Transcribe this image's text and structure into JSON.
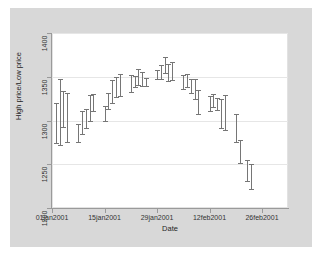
{
  "chart_data": {
    "type": "bar",
    "subtype": "range-high-low",
    "title": "",
    "xlabel": "Date",
    "ylabel": "High price/Low price",
    "ylim": [
      1200,
      1400
    ],
    "yticks": [
      1200,
      1250,
      1300,
      1350,
      1400
    ],
    "ytick_labels": [
      "1200",
      "1250",
      "1300",
      "1350",
      "1400"
    ],
    "xticks": [
      "01jan2001",
      "15jan2001",
      "29jan2001",
      "12feb2001",
      "26feb2001"
    ],
    "xtick_days": [
      0,
      14,
      28,
      42,
      56
    ],
    "grid": true,
    "legend": null,
    "series": [
      {
        "name": "High price/Low price",
        "low_name": "Low price",
        "high_name": "High price",
        "color": "#767676",
        "points": [
          {
            "day": 1,
            "date": "02jan2001",
            "low": 1274,
            "high": 1320
          },
          {
            "day": 2,
            "date": "03jan2001",
            "low": 1272,
            "high": 1348
          },
          {
            "day": 3,
            "date": "04jan2001",
            "low": 1293,
            "high": 1334
          },
          {
            "day": 4,
            "date": "05jan2001",
            "low": 1276,
            "high": 1331
          },
          {
            "day": 7,
            "date": "08jan2001",
            "low": 1275,
            "high": 1296
          },
          {
            "day": 8,
            "date": "09jan2001",
            "low": 1285,
            "high": 1311
          },
          {
            "day": 9,
            "date": "10jan2001",
            "low": 1291,
            "high": 1313
          },
          {
            "day": 10,
            "date": "11jan2001",
            "low": 1300,
            "high": 1329
          },
          {
            "day": 11,
            "date": "12jan2001",
            "low": 1311,
            "high": 1330
          },
          {
            "day": 14,
            "date": "16jan2001",
            "low": 1300,
            "high": 1317
          },
          {
            "day": 15,
            "date": "17jan2001",
            "low": 1313,
            "high": 1332
          },
          {
            "day": 16,
            "date": "18jan2001",
            "low": 1320,
            "high": 1346
          },
          {
            "day": 17,
            "date": "19jan2001",
            "low": 1327,
            "high": 1350
          },
          {
            "day": 18,
            "date": "22jan2001",
            "low": 1328,
            "high": 1353
          },
          {
            "day": 21,
            "date": "23jan2001",
            "low": 1333,
            "high": 1352
          },
          {
            "day": 22,
            "date": "24jan2001",
            "low": 1338,
            "high": 1351
          },
          {
            "day": 23,
            "date": "25jan2001",
            "low": 1341,
            "high": 1359
          },
          {
            "day": 24,
            "date": "26jan2001",
            "low": 1340,
            "high": 1355
          },
          {
            "day": 25,
            "date": "29jan2001",
            "low": 1339,
            "high": 1349
          },
          {
            "day": 28,
            "date": "30jan2001",
            "low": 1347,
            "high": 1358
          },
          {
            "day": 29,
            "date": "31jan2001",
            "low": 1348,
            "high": 1364
          },
          {
            "day": 30,
            "date": "01feb2001",
            "low": 1354,
            "high": 1373
          },
          {
            "day": 31,
            "date": "02feb2001",
            "low": 1345,
            "high": 1365
          },
          {
            "day": 32,
            "date": "05feb2001",
            "low": 1346,
            "high": 1367
          },
          {
            "day": 35,
            "date": "06feb2001",
            "low": 1336,
            "high": 1352
          },
          {
            "day": 36,
            "date": "07feb2001",
            "low": 1338,
            "high": 1353
          },
          {
            "day": 37,
            "date": "08feb2001",
            "low": 1331,
            "high": 1348
          },
          {
            "day": 38,
            "date": "09feb2001",
            "low": 1325,
            "high": 1348
          },
          {
            "day": 39,
            "date": "12feb2001",
            "low": 1308,
            "high": 1335
          },
          {
            "day": 42,
            "date": "13feb2001",
            "low": 1311,
            "high": 1328
          },
          {
            "day": 43,
            "date": "14feb2001",
            "low": 1315,
            "high": 1330
          },
          {
            "day": 44,
            "date": "15feb2001",
            "low": 1312,
            "high": 1326
          },
          {
            "day": 45,
            "date": "16feb2001",
            "low": 1291,
            "high": 1325
          },
          {
            "day": 46,
            "date": "20feb2001",
            "low": 1289,
            "high": 1329
          },
          {
            "day": 49,
            "date": "21feb2001",
            "low": 1275,
            "high": 1308
          },
          {
            "day": 50,
            "date": "22feb2001",
            "low": 1252,
            "high": 1278
          },
          {
            "day": 52,
            "date": "23feb2001",
            "low": 1231,
            "high": 1255
          },
          {
            "day": 53,
            "date": "26feb2001",
            "low": 1222,
            "high": 1250
          }
        ]
      }
    ]
  }
}
